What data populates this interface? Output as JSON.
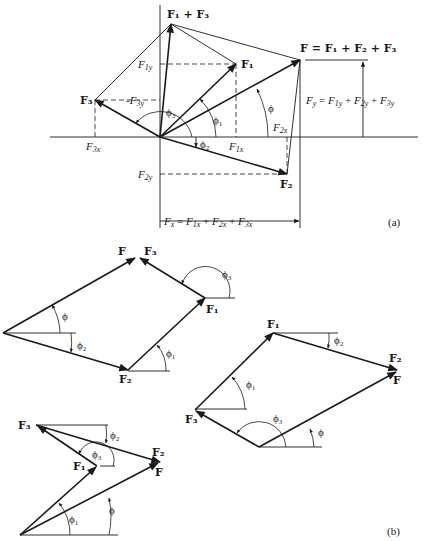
{
  "figure": {
    "part_a_label": "(a)",
    "part_b_label": "(b)"
  },
  "part_a": {
    "origin": [
      160,
      137
    ],
    "axes": {
      "x_from": 50,
      "x_to": 418,
      "y_from": 5,
      "y_to": 228
    },
    "points": {
      "F1": [
        236,
        64
      ],
      "F2": [
        287,
        174
      ],
      "F3": [
        95,
        100
      ],
      "F1_plus_F3": [
        171,
        24
      ],
      "F": [
        300,
        60
      ]
    },
    "labels": {
      "F1_plus_F3": "F₁ + F₃",
      "F1": "F₁",
      "F2": "F₂",
      "F3": "F₃",
      "F_sum": "F = F₁ + F₂ + F₃",
      "Fy_sum": "F_y = F_1y + F_2y + F_3y",
      "Fx_sum": "F_x = F_1x + F_2x + F_3x",
      "F1y": "F_1y",
      "F3y": "-F_3y",
      "F2y": "F_2y",
      "F1x": "F_1x",
      "F2x": "F_2x",
      "F3x": "F_3x",
      "phi": "ϕ",
      "phi1": "ϕ₁",
      "phi2": "ϕ₂",
      "phi3": "ϕ₃"
    }
  },
  "part_b": {
    "diagrams": [
      {
        "id": "top-left",
        "order": [
          "F2",
          "F1",
          "F3"
        ],
        "origin": [
          3,
          333
        ],
        "p1": [
          128,
          370
        ],
        "p2": [
          205,
          298
        ],
        "end": [
          137,
          257
        ],
        "labels": {
          "F": "F",
          "F1": "F₁",
          "F2": "F₂",
          "F3": "F₃",
          "phi": "ϕ",
          "phi1": "ϕ₁",
          "phi2": "ϕ₂",
          "phi3": "ϕ₃"
        }
      },
      {
        "id": "right",
        "order": [
          "F3",
          "F1",
          "F2"
        ],
        "origin": [
          259,
          447
        ],
        "p1": [
          195,
          410
        ],
        "p2": [
          273,
          333
        ],
        "end": [
          397,
          370
        ],
        "labels": {
          "F": "F",
          "F1": "F₁",
          "F2": "F₂",
          "F3": "F₃",
          "phi": "ϕ",
          "phi1": "ϕ₁",
          "phi2": "ϕ₂",
          "phi3": "ϕ₃"
        }
      },
      {
        "id": "bottom-left",
        "order": [
          "F1",
          "F3",
          "F2"
        ],
        "origin": [
          20,
          535
        ],
        "p1": [
          97,
          466
        ],
        "p2": [
          36,
          425
        ],
        "end": [
          160,
          462
        ],
        "labels": {
          "F": "F",
          "F1": "F₁",
          "F2": "F₂",
          "F3": "F₃",
          "phi": "ϕ",
          "phi1": "ϕ₁",
          "phi2": "ϕ₂",
          "phi3": "ϕ₃"
        }
      }
    ]
  }
}
